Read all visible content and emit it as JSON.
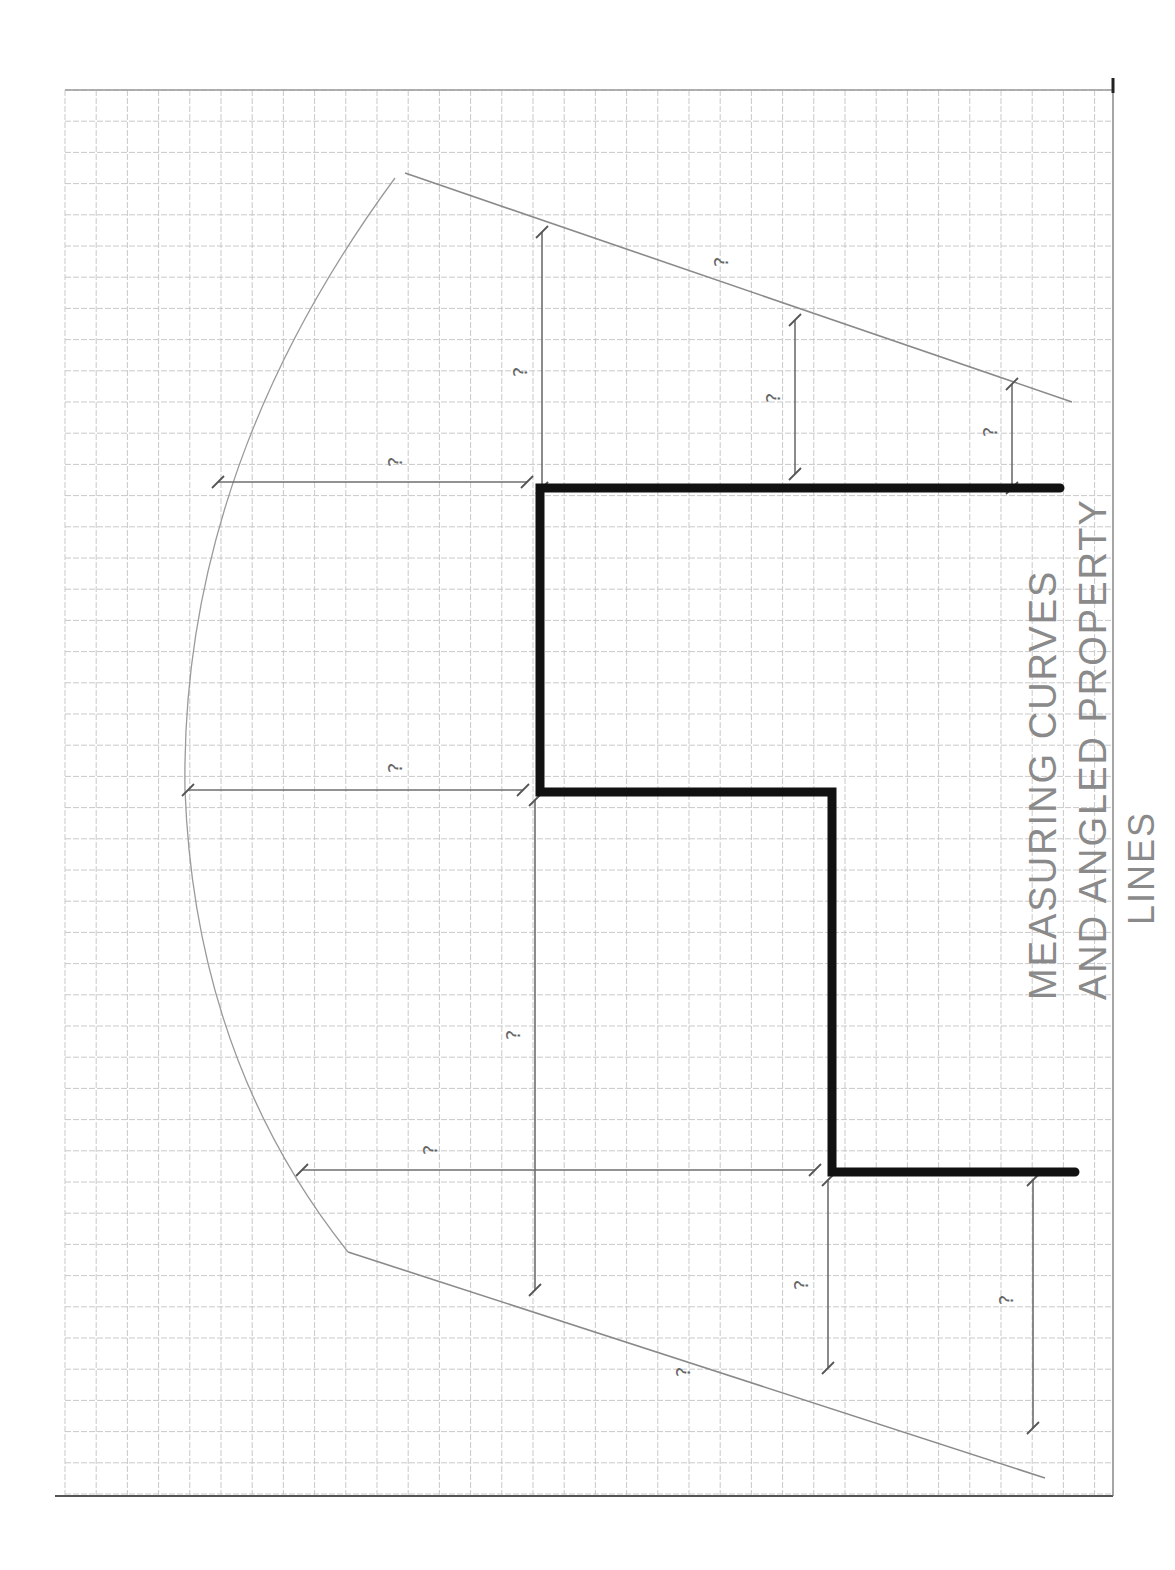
{
  "sheet": {
    "paper_color": "#ffffff",
    "grid_color": "#c9c9c9",
    "grid": {
      "left": 65,
      "top": 90,
      "right": 1113,
      "bottom": 1495,
      "cell": 31.2
    }
  },
  "title": {
    "lines": [
      "MEASURING CURVES",
      "AND ANGLED PROPERTY",
      "LINES"
    ]
  },
  "house_outline": {
    "color": "#111111",
    "points": [
      [
        1060,
        488
      ],
      [
        540,
        488
      ],
      [
        540,
        792
      ],
      [
        832,
        792
      ],
      [
        832,
        1172
      ],
      [
        1075,
        1172
      ]
    ]
  },
  "property_lines": {
    "color": "#8a8a8a",
    "top_angled": {
      "from": [
        405,
        173
      ],
      "to": [
        1072,
        402
      ]
    },
    "bottom_angled": {
      "from": [
        348,
        1252
      ],
      "to": [
        1045,
        1478
      ]
    },
    "curve": {
      "from": [
        395,
        178
      ],
      "control_top": [
        180,
        470
      ],
      "mid": [
        185,
        790
      ],
      "control_bottom": [
        195,
        1060
      ],
      "to": [
        348,
        1252
      ]
    }
  },
  "dimensions": [
    {
      "id": "dim-top-vertical-1",
      "label": "?",
      "x1": 542,
      "y1": 232,
      "x2": 542,
      "y2": 488,
      "label_pos": [
        527,
        372
      ]
    },
    {
      "id": "dim-top-vertical-2",
      "label": "?",
      "x1": 795,
      "y1": 320,
      "x2": 795,
      "y2": 474,
      "label_pos": [
        780,
        398
      ]
    },
    {
      "id": "dim-top-vertical-3",
      "label": "?",
      "x1": 1012,
      "y1": 384,
      "x2": 1012,
      "y2": 488,
      "label_pos": [
        997,
        432
      ]
    },
    {
      "id": "dim-top-angled",
      "label": "?",
      "x1": 0,
      "y1": 0,
      "x2": 0,
      "y2": 0,
      "label_pos": [
        728,
        262
      ]
    },
    {
      "id": "dim-horizontal-1",
      "label": "?",
      "x1": 218,
      "y1": 482,
      "x2": 527,
      "y2": 482,
      "label_pos": [
        402,
        462
      ]
    },
    {
      "id": "dim-horizontal-2",
      "label": "?",
      "x1": 188,
      "y1": 790,
      "x2": 523,
      "y2": 790,
      "label_pos": [
        402,
        768
      ]
    },
    {
      "id": "dim-middle-vertical",
      "label": "?",
      "x1": 535,
      "y1": 800,
      "x2": 535,
      "y2": 1290,
      "label_pos": [
        520,
        1035
      ]
    },
    {
      "id": "dim-horizontal-3",
      "label": "?",
      "x1": 302,
      "y1": 1170,
      "x2": 815,
      "y2": 1170,
      "label_pos": [
        437,
        1150
      ]
    },
    {
      "id": "dim-bottom-vertical-1",
      "label": "?",
      "x1": 828,
      "y1": 1180,
      "x2": 828,
      "y2": 1368,
      "label_pos": [
        808,
        1285
      ]
    },
    {
      "id": "dim-bottom-vertical-2",
      "label": "?",
      "x1": 1033,
      "y1": 1180,
      "x2": 1033,
      "y2": 1428,
      "label_pos": [
        1013,
        1300
      ]
    },
    {
      "id": "dim-bottom-angled",
      "label": "?",
      "x1": 0,
      "y1": 0,
      "x2": 0,
      "y2": 0,
      "label_pos": [
        690,
        1372
      ]
    }
  ],
  "bottom_rule": {
    "y": 1496,
    "from": 55,
    "to": 1113,
    "color": "#555555"
  }
}
